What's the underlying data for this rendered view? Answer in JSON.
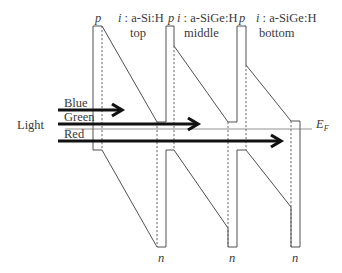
{
  "diagram": {
    "type": "band-diagram",
    "light_label": "Light",
    "fermi_label": "E",
    "fermi_subscript": "F",
    "layers": [
      {
        "p_label": "p",
        "i_prefix": "i",
        "i_material": " : a-Si:H",
        "cell_name": "top",
        "n_label": "n"
      },
      {
        "p_label": "p",
        "i_prefix": "i",
        "i_material": " : a-SiGe:H",
        "cell_name": "middle",
        "n_label": "n"
      },
      {
        "p_label": "p",
        "i_prefix": "i",
        "i_material": " : a-SiGe:H",
        "cell_name": "bottom",
        "n_label": "n"
      }
    ],
    "light_rays": [
      {
        "label": "Blue"
      },
      {
        "label": "Green"
      },
      {
        "label": "Red"
      }
    ]
  },
  "colors": {
    "line": "#3c3c3c",
    "arrow": "#111111",
    "fermi": "#777777"
  }
}
